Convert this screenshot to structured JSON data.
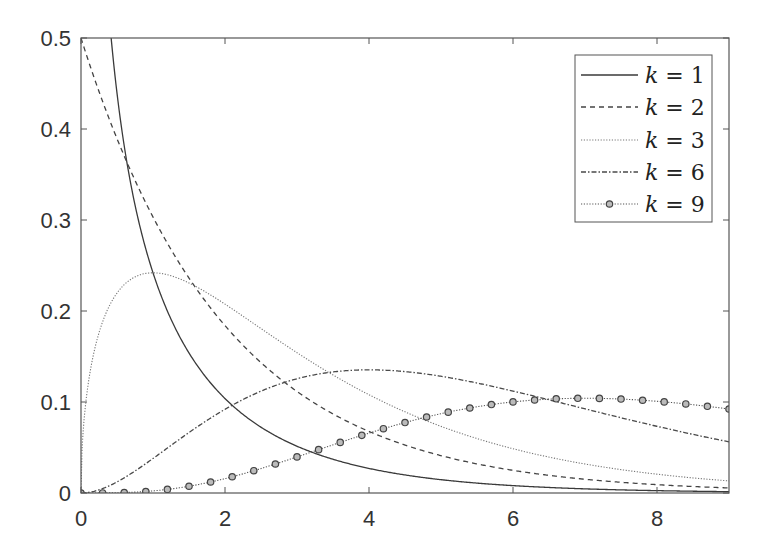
{
  "chart_data": {
    "type": "line",
    "title": "",
    "xlabel": "",
    "ylabel": "",
    "xlim": [
      0,
      9
    ],
    "ylim": [
      0,
      0.5
    ],
    "grid": false,
    "legend_position": "upper right",
    "x_ticks": [
      0,
      2,
      4,
      6,
      8
    ],
    "x_tick_labels": [
      "0",
      "2",
      "4",
      "6",
      "8"
    ],
    "y_ticks": [
      0,
      0.1,
      0.2,
      0.3,
      0.4,
      0.5
    ],
    "y_tick_labels": [
      "0",
      "0.1",
      "0.2",
      "0.3",
      "0.4",
      "0.5"
    ],
    "function": "chi-squared probability density f(x; k)",
    "series": [
      {
        "name": "k = 1",
        "k": 1,
        "style": "solid",
        "marker": "none",
        "x": [
          0.1,
          0.3,
          0.5,
          1,
          1.5,
          2,
          3,
          4,
          5,
          6,
          7,
          8,
          9
        ],
        "values": [
          1.2,
          0.627,
          0.439,
          0.242,
          0.154,
          0.104,
          0.051,
          0.027,
          0.015,
          0.008,
          0.005,
          0.003,
          0.001
        ]
      },
      {
        "name": "k = 2",
        "k": 2,
        "style": "dashed",
        "marker": "none",
        "x": [
          0,
          0.5,
          1,
          1.5,
          2,
          3,
          4,
          5,
          6,
          7,
          8,
          9
        ],
        "values": [
          0.5,
          0.389,
          0.303,
          0.236,
          0.184,
          0.112,
          0.068,
          0.041,
          0.025,
          0.015,
          0.009,
          0.006
        ]
      },
      {
        "name": "k = 3",
        "k": 3,
        "style": "dotted",
        "marker": "none",
        "x": [
          0,
          0.5,
          1,
          1.5,
          2,
          3,
          4,
          5,
          6,
          7,
          8,
          9
        ],
        "values": [
          0.0,
          0.22,
          0.242,
          0.231,
          0.208,
          0.154,
          0.108,
          0.073,
          0.048,
          0.032,
          0.021,
          0.013
        ]
      },
      {
        "name": "k = 6",
        "k": 6,
        "style": "dash-dot",
        "marker": "none",
        "x": [
          0,
          1,
          2,
          3,
          4,
          5,
          6,
          7,
          8,
          9
        ],
        "values": [
          0.0,
          0.076,
          0.092,
          0.126,
          0.135,
          0.128,
          0.112,
          0.092,
          0.073,
          0.056
        ]
      },
      {
        "name": "k = 9",
        "k": 9,
        "style": "dotted",
        "marker": "circle",
        "x": [
          0,
          1,
          2,
          3,
          4,
          5,
          6,
          7,
          8,
          9
        ],
        "values": [
          0.0,
          0.002,
          0.017,
          0.047,
          0.077,
          0.095,
          0.101,
          0.098,
          0.089,
          0.077
        ]
      }
    ],
    "marker_spacing": 0.3
  },
  "legend": {
    "items": [
      {
        "var": "k",
        "eq": " = ",
        "val": "1"
      },
      {
        "var": "k",
        "eq": " = ",
        "val": "2"
      },
      {
        "var": "k",
        "eq": " = ",
        "val": "3"
      },
      {
        "var": "k",
        "eq": " = ",
        "val": "6"
      },
      {
        "var": "k",
        "eq": " = ",
        "val": "9"
      }
    ]
  },
  "colors": {
    "axis": "#555555",
    "k1": "#3a3a3a",
    "k2": "#444444",
    "k3": "#777777",
    "k6": "#4a4a4a",
    "k9": "#555555",
    "marker_fill": "#bbbbbb"
  }
}
